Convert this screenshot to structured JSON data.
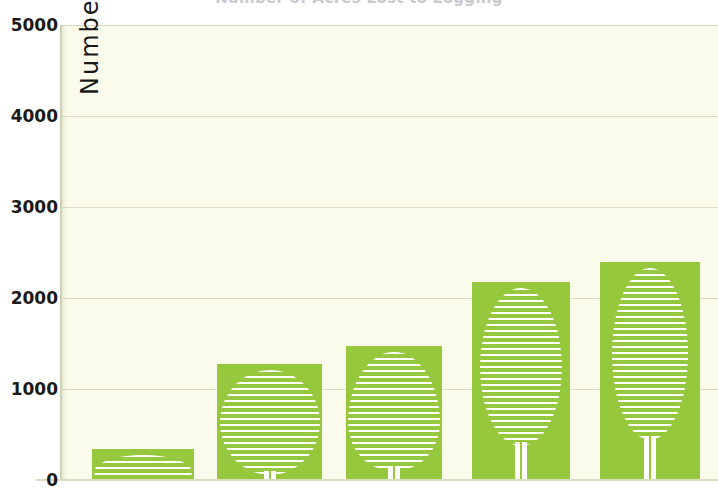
{
  "title": {
    "text": "Number of Acres Lost to Logging",
    "note": "cut off at top edge of screenshot"
  },
  "colors": {
    "bar_green": "#95c83c",
    "plot_background": "#fbfbeb",
    "gridline": "#ddddc4",
    "axis_line": "#cfd2b4",
    "tick_text": "#1a1a1a",
    "tree_stripe": "#ffffff"
  },
  "chart_data": {
    "type": "bar",
    "title": "Number of Acres Lost to Logging",
    "xlabel": "",
    "ylabel": "Number of Acres",
    "ylim": [
      0,
      5000
    ],
    "ytick_labels": [
      "0",
      "1000",
      "2000",
      "3000",
      "4000",
      "5000"
    ],
    "ytick_values": [
      0,
      1000,
      2000,
      3000,
      4000,
      5000
    ],
    "grid": true,
    "legend": "none",
    "categories": [
      "1",
      "2",
      "3",
      "4",
      "5"
    ],
    "values": [
      340,
      1270,
      1470,
      2180,
      2400
    ],
    "series": [
      {
        "name": "Number of Acres",
        "values": [
          340,
          1270,
          1470,
          2180,
          2400
        ]
      }
    ],
    "annotations": [
      "Each bar is decorated with a white horizontally-striped tree motif (canopy plus trunk); the canopy grows taller and narrower as the bar value increases."
    ]
  },
  "y_axis": {
    "title": "Number of Acres",
    "ticks": [
      {
        "label": "5000",
        "value": 5000
      },
      {
        "label": "4000",
        "value": 4000
      },
      {
        "label": "3000",
        "value": 3000
      },
      {
        "label": "2000",
        "value": 2000
      },
      {
        "label": "1000",
        "value": 1000
      },
      {
        "label": "0",
        "value": 0
      }
    ]
  },
  "bars": [
    {
      "name": "bar-1",
      "value": 340,
      "tree": "flat-wide-canopy"
    },
    {
      "name": "bar-2",
      "value": 1270,
      "tree": "round-canopy"
    },
    {
      "name": "bar-3",
      "value": 1470,
      "tree": "egg-canopy"
    },
    {
      "name": "bar-4",
      "value": 2180,
      "tree": "tall-oval-canopy"
    },
    {
      "name": "bar-5",
      "value": 2400,
      "tree": "tall-narrow-canopy"
    }
  ]
}
